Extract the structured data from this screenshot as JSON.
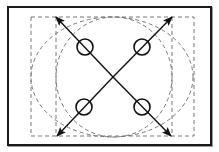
{
  "diagram": {
    "title": "",
    "frame": {
      "x": 7,
      "y": 6,
      "w": 205,
      "h": 140,
      "color": "#1a1a1a"
    },
    "dashed_rect_outer": {
      "x": 31,
      "y": 17,
      "w": 163,
      "h": 119
    },
    "dashed_lines_vertical": [
      {
        "x": 56,
        "y1": 17,
        "y2": 136
      },
      {
        "x": 172,
        "y1": 17,
        "y2": 136
      }
    ],
    "dashed_ellipses": [
      {
        "name": "outer-ellipse",
        "cx": 112,
        "cy": 77,
        "rx": 81,
        "ry": 60
      },
      {
        "name": "inner-ellipse",
        "cx": 114,
        "cy": 77,
        "rx": 58,
        "ry": 60
      }
    ],
    "center": {
      "x": 113,
      "y": 77
    },
    "arrows": [
      {
        "name": "arrow-top-left",
        "x1": 113,
        "y1": 77,
        "x2": 56,
        "y2": 17
      },
      {
        "name": "arrow-top-right",
        "x1": 113,
        "y1": 77,
        "x2": 172,
        "y2": 17
      },
      {
        "name": "arrow-bottom-left",
        "x1": 113,
        "y1": 77,
        "x2": 57,
        "y2": 136
      },
      {
        "name": "arrow-bottom-right",
        "x1": 113,
        "y1": 77,
        "x2": 171,
        "y2": 136
      }
    ],
    "circles": [
      {
        "name": "circle-top-left",
        "cx": 85,
        "cy": 47,
        "r": 8
      },
      {
        "name": "circle-top-right",
        "cx": 142,
        "cy": 47,
        "r": 8
      },
      {
        "name": "circle-bottom-left",
        "cx": 84,
        "cy": 107,
        "r": 8
      },
      {
        "name": "circle-bottom-right",
        "cx": 142,
        "cy": 107,
        "r": 8
      }
    ],
    "colors": {
      "stroke": "#111111",
      "dashed": "#777777",
      "background": "#ffffff"
    }
  }
}
